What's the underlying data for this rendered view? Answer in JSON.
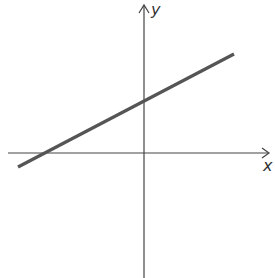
{
  "diagram": {
    "type": "coordinate-plane-linear-function",
    "axes": {
      "x_label": "x",
      "y_label": "y"
    },
    "line": {
      "description": "straight line with positive slope, positive y-intercept and negative x-intercept",
      "color": "#555555"
    },
    "colors": {
      "axis": "#444444",
      "background": "#ffffff"
    }
  }
}
